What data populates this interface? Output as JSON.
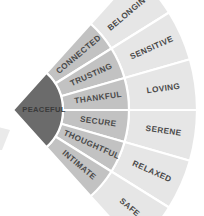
{
  "diagram": {
    "type": "radial-fan",
    "background_color": "#ffffff",
    "divider_color": "#ffffff",
    "core": {
      "label": "PEACEFUL",
      "fill": "#6b6b6b",
      "text_color": "#3a3a3a"
    },
    "rings": [
      {
        "name": "inner-ring",
        "fill": "#c2c2c2",
        "text_color": "#4a4a4a",
        "segments": [
          {
            "label": "CONNECTED"
          },
          {
            "label": "TRUSTING"
          },
          {
            "label": "THANKFUL"
          },
          {
            "label": "SECURE"
          },
          {
            "label": "THOUGHTFUL"
          },
          {
            "label": "INTIMATE"
          }
        ]
      },
      {
        "name": "outer-ring",
        "fill": "#e6e6e6",
        "text_color": "#4a4a4a",
        "segments": [
          {
            "label": "BELONGING"
          },
          {
            "label": "SENSITIVE"
          },
          {
            "label": "LOVING"
          },
          {
            "label": "SERENE"
          },
          {
            "label": "RELAXED"
          },
          {
            "label": "SAFE"
          }
        ]
      }
    ],
    "geometry": {
      "center_x": 13,
      "center_y": 110,
      "core_radius": 50,
      "inner_ring_outer_radius": 116,
      "outer_ring_outer_radius": 184,
      "start_angle_deg": -48,
      "end_angle_deg": 48,
      "segment_count": 6
    },
    "edge_artifact": {
      "name": "clipped-neighbor-wedge",
      "fill": "#d8d8d8"
    }
  }
}
